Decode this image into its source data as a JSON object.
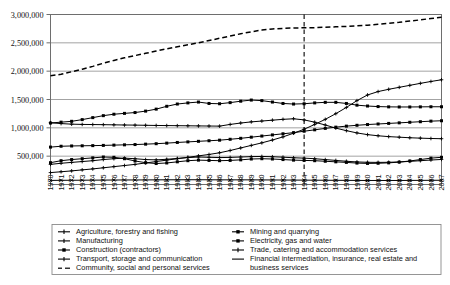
{
  "chart_data": {
    "type": "line",
    "title": "",
    "xlabel": "",
    "ylabel": "",
    "ylim": [
      0,
      3000000
    ],
    "xlim": [
      1970,
      2007
    ],
    "grid": true,
    "legend_position": "bottom",
    "y_ticks": [
      "500,000",
      "1,000,000",
      "1,500,000",
      "2,000,000",
      "2,500,000",
      "3,000,000"
    ],
    "y_tick_values": [
      500000,
      1000000,
      1500000,
      2000000,
      2500000,
      3000000
    ],
    "x": [
      1970,
      1971,
      1972,
      1973,
      1974,
      1975,
      1976,
      1977,
      1978,
      1979,
      1980,
      1981,
      1982,
      1983,
      1984,
      1985,
      1986,
      1987,
      1988,
      1989,
      1990,
      1991,
      1992,
      1993,
      1994,
      1995,
      1996,
      1997,
      1998,
      1999,
      2000,
      2001,
      2002,
      2003,
      2004,
      2005,
      2006,
      2007
    ],
    "x_tick_labels": [
      "1970",
      "1971",
      "1972",
      "1973",
      "1974",
      "1975",
      "1976",
      "1977",
      "1978",
      "1979",
      "1980",
      "1981",
      "1982",
      "1983",
      "1984",
      "1985",
      "1986",
      "1987",
      "1988",
      "1989",
      "1990",
      "1991",
      "1992",
      "1993",
      "1994",
      "1995",
      "1996",
      "1997",
      "1998",
      "1999",
      "2000",
      "2001",
      "2002",
      "2003",
      "2004",
      "2005",
      "2006",
      "2007"
    ],
    "annotations": [
      {
        "type": "vertical-line",
        "x": 1994,
        "style": "dashed",
        "label": ""
      }
    ],
    "series": [
      {
        "name": "Agriculture, forestry and fishing",
        "marker": "plus",
        "dash": "solid",
        "values": [
          1090000,
          1075000,
          1065000,
          1060000,
          1058000,
          1056000,
          1053000,
          1050000,
          1048000,
          1045000,
          1042000,
          1040000,
          1038000,
          1036000,
          1034000,
          1032000,
          1030000,
          1060000,
          1085000,
          1105000,
          1120000,
          1135000,
          1150000,
          1160000,
          1140000,
          1100000,
          1050000,
          995000,
          950000,
          910000,
          880000,
          860000,
          845000,
          835000,
          825000,
          818000,
          812000,
          808000
        ]
      },
      {
        "name": "Manufacturing",
        "marker": "square",
        "dash": "solid",
        "values": [
          1085000,
          1100000,
          1115000,
          1145000,
          1180000,
          1215000,
          1240000,
          1255000,
          1270000,
          1295000,
          1330000,
          1380000,
          1420000,
          1440000,
          1455000,
          1430000,
          1425000,
          1445000,
          1470000,
          1490000,
          1480000,
          1455000,
          1430000,
          1420000,
          1425000,
          1440000,
          1450000,
          1450000,
          1430000,
          1400000,
          1385000,
          1375000,
          1370000,
          1368000,
          1368000,
          1370000,
          1372000,
          1372000
        ]
      },
      {
        "name": "Construction (contractors)",
        "marker": "square",
        "dash": "solid",
        "values": [
          385000,
          420000,
          440000,
          455000,
          470000,
          485000,
          480000,
          455000,
          415000,
          385000,
          370000,
          380000,
          400000,
          420000,
          430000,
          425000,
          420000,
          425000,
          435000,
          450000,
          455000,
          450000,
          440000,
          430000,
          425000,
          420000,
          410000,
          400000,
          390000,
          378000,
          372000,
          375000,
          382000,
          395000,
          415000,
          440000,
          465000,
          480000
        ]
      },
      {
        "name": "Transport, storage and communication",
        "marker": "plus",
        "dash": "solid",
        "values": [
          355000,
          375000,
          390000,
          405000,
          420000,
          440000,
          455000,
          465000,
          455000,
          440000,
          435000,
          445000,
          460000,
          475000,
          485000,
          480000,
          475000,
          478000,
          485000,
          492000,
          495000,
          490000,
          482000,
          472000,
          465000,
          455000,
          440000,
          425000,
          410000,
          398000,
          392000,
          390000,
          392000,
          398000,
          408000,
          420000,
          432000,
          442000
        ]
      },
      {
        "name": "Community, social and personal services",
        "marker": "dash",
        "dash": "dashed",
        "values": [
          1920000,
          1945000,
          1990000,
          2035000,
          2085000,
          2140000,
          2190000,
          2235000,
          2275000,
          2315000,
          2355000,
          2395000,
          2430000,
          2465000,
          2500000,
          2540000,
          2580000,
          2620000,
          2660000,
          2695000,
          2725000,
          2745000,
          2755000,
          2762000,
          2765000,
          2768000,
          2775000,
          2782000,
          2790000,
          2800000,
          2812000,
          2828000,
          2845000,
          2862000,
          2885000,
          2905000,
          2930000,
          2950000
        ]
      },
      {
        "name": "Mining and quarrying",
        "marker": "x",
        "dash": "solid",
        "values": [
          72000,
          74000,
          75000,
          76000,
          77000,
          78000,
          79000,
          80000,
          80000,
          81000,
          82000,
          83000,
          83000,
          84000,
          84000,
          83000,
          82000,
          82000,
          82000,
          82000,
          81000,
          80000,
          79000,
          78000,
          77000,
          76000,
          75000,
          74000,
          73000,
          72000,
          71000,
          71000,
          71000,
          71000,
          72000,
          73000,
          74000,
          75000
        ]
      },
      {
        "name": "Electricity, gas and water",
        "marker": "square",
        "dash": "solid",
        "values": [
          660000,
          675000,
          680000,
          683000,
          686000,
          690000,
          695000,
          700000,
          705000,
          712000,
          720000,
          730000,
          742000,
          752000,
          762000,
          772000,
          782000,
          798000,
          815000,
          835000,
          855000,
          875000,
          895000,
          915000,
          940000,
          965000,
          990000,
          1012000,
          1030000,
          1045000,
          1058000,
          1068000,
          1078000,
          1088000,
          1098000,
          1108000,
          1118000,
          1125000
        ]
      },
      {
        "name": "Trade, catering and accommodation services",
        "marker": "plus",
        "dash": "solid",
        "values": [
          210000,
          225000,
          240000,
          258000,
          275000,
          295000,
          315000,
          335000,
          355000,
          380000,
          405000,
          430000,
          455000,
          480000,
          505000,
          530000,
          560000,
          600000,
          645000,
          690000,
          735000,
          785000,
          840000,
          905000,
          975000,
          1060000,
          1150000,
          1250000,
          1360000,
          1480000,
          1580000,
          1640000,
          1680000,
          1715000,
          1750000,
          1785000,
          1818000,
          1848000
        ]
      }
    ]
  },
  "legend": {
    "column_left": [
      {
        "label": "Agriculture, forestry and fishing",
        "marker": "plus"
      },
      {
        "label": "Manufacturing",
        "marker": "plus"
      },
      {
        "label": "Construction (contractors)",
        "marker": "square"
      },
      {
        "label": "Transport, storage and communication",
        "marker": "plus"
      },
      {
        "label": "Community, social and personal services",
        "marker": "dash"
      }
    ],
    "column_right": [
      {
        "label": "Mining and quarrying",
        "marker": "square"
      },
      {
        "label": "Electricity, gas and water",
        "marker": "square"
      },
      {
        "label": "Trade, catering and accommodation services",
        "marker": "plus"
      },
      {
        "label": "Financial intermediation, insurance, real estate and",
        "marker": "line"
      },
      {
        "label": "business services",
        "marker": "none"
      }
    ]
  }
}
